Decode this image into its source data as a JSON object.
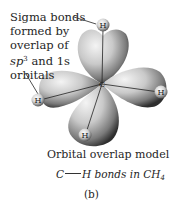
{
  "figure": {
    "annotation": {
      "lines": [
        "Sigma bonds",
        "formed by",
        "overlap of"
      ],
      "line4_prefix": "sp",
      "line4_superscript": "3",
      "line4_suffix": " and 1s",
      "line5": "orbitals"
    },
    "atoms": {
      "center": "C",
      "hydrogen_top": "H",
      "hydrogen_left": "H",
      "hydrogen_right": "H",
      "hydrogen_bottom": "H"
    },
    "caption": {
      "title": "Orbital overlap model",
      "bond_left": "C",
      "bond_right": "H bonds in CH",
      "bond_subscript": "4",
      "panel_label": "(b)"
    },
    "colors": {
      "background": "#ffffff",
      "lobe_light": "#f0f0f0",
      "lobe_dark": "#3a3a3a",
      "text": "#262626"
    }
  }
}
